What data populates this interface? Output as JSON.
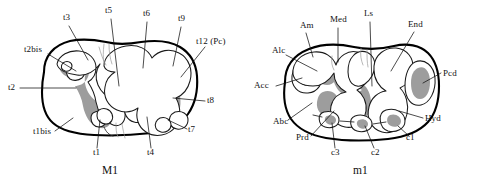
{
  "figure": {
    "background_color": "#ffffff",
    "ink_color": "#000000",
    "enamel_fill_color": "#9d9d9d"
  },
  "panels": [
    {
      "id": "M1",
      "caption": "M1",
      "caption_x": 102,
      "caption_y": 170,
      "labels": [
        {
          "text": "t3",
          "x": 63,
          "y": 18,
          "anchor": "start"
        },
        {
          "text": "t5",
          "x": 105,
          "y": 11,
          "anchor": "start"
        },
        {
          "text": "t6",
          "x": 143,
          "y": 14,
          "anchor": "start"
        },
        {
          "text": "t9",
          "x": 178,
          "y": 19,
          "anchor": "start"
        },
        {
          "text": "t12 (Pc)",
          "x": 196,
          "y": 42,
          "anchor": "start"
        },
        {
          "text": "t2bis",
          "x": 24,
          "y": 50,
          "anchor": "start"
        },
        {
          "text": "t2",
          "x": 8,
          "y": 90,
          "anchor": "start"
        },
        {
          "text": "t8",
          "x": 207,
          "y": 101,
          "anchor": "start"
        },
        {
          "text": "t1bis",
          "x": 33,
          "y": 134,
          "anchor": "start"
        },
        {
          "text": "t7",
          "x": 188,
          "y": 132,
          "anchor": "start"
        },
        {
          "text": "t1",
          "x": 93,
          "y": 152,
          "anchor": "start"
        },
        {
          "text": "t4",
          "x": 147,
          "y": 152,
          "anchor": "start"
        }
      ]
    },
    {
      "id": "m1",
      "caption": "m1",
      "caption_x": 353,
      "caption_y": 170,
      "labels": [
        {
          "text": "Am",
          "x": 300,
          "y": 26,
          "anchor": "start"
        },
        {
          "text": "Med",
          "x": 330,
          "y": 20,
          "anchor": "start"
        },
        {
          "text": "Ls",
          "x": 364,
          "y": 14,
          "anchor": "start"
        },
        {
          "text": "End",
          "x": 408,
          "y": 25,
          "anchor": "start"
        },
        {
          "text": "Alc",
          "x": 272,
          "y": 51,
          "anchor": "start"
        },
        {
          "text": "Acc",
          "x": 254,
          "y": 88,
          "anchor": "start"
        },
        {
          "text": "Pcd",
          "x": 443,
          "y": 74,
          "anchor": "start"
        },
        {
          "text": "Abc",
          "x": 273,
          "y": 124,
          "anchor": "start"
        },
        {
          "text": "Hyd",
          "x": 425,
          "y": 121,
          "anchor": "start"
        },
        {
          "text": "Prd",
          "x": 296,
          "y": 140,
          "anchor": "start"
        },
        {
          "text": "c3",
          "x": 331,
          "y": 152,
          "anchor": "start"
        },
        {
          "text": "c2",
          "x": 371,
          "y": 152,
          "anchor": "start"
        },
        {
          "text": "c1",
          "x": 406,
          "y": 140,
          "anchor": "start"
        }
      ]
    }
  ],
  "annotations": {
    "label_count": 25,
    "panel_count": 2
  }
}
